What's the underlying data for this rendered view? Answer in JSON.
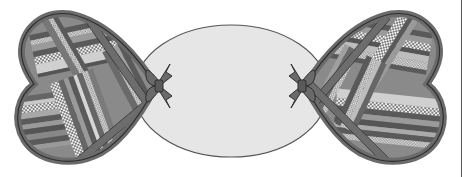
{
  "illustration": {
    "subject": "Candy-shaped quilt with two heart-shaped patchwork ends tied with bows to a central oval",
    "colors": {
      "outline": "#3a3a3a",
      "border_band": "#6b6b6b",
      "oval_fill": "#e6e6e6",
      "oval_stroke": "#555555",
      "stripe_dark": "#5a5a5a",
      "stripe_mid": "#8a8a8a",
      "stripe_light": "#bdbdbd",
      "stripe_pale": "#d6d6d6",
      "bow_fill": "#6a6a6a",
      "background": "#ffffff"
    },
    "oval": {
      "cx": 231,
      "cy": 91,
      "rx": 97,
      "ry": 66
    },
    "left_heart": {
      "tip_x": 158,
      "tip_y": 86
    },
    "right_heart": {
      "tip_x": 303,
      "tip_y": 86
    },
    "bows": [
      {
        "side": "left",
        "x": 160,
        "y": 86
      },
      {
        "side": "right",
        "x": 300,
        "y": 86
      }
    ]
  }
}
